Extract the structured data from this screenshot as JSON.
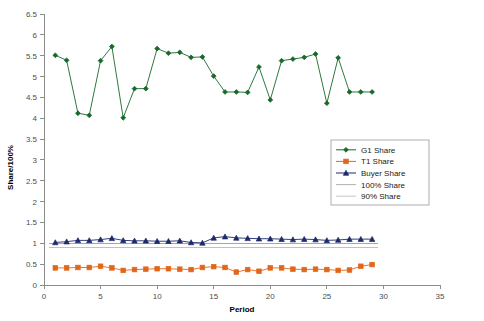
{
  "chart_data": {
    "type": "line",
    "title": "",
    "xlabel": "Period",
    "ylabel": "Share/100%",
    "xlim": [
      0,
      35
    ],
    "ylim": [
      0,
      6.5
    ],
    "xticks": [
      0,
      5,
      10,
      15,
      20,
      25,
      30,
      35
    ],
    "yticks": [
      0,
      0.5,
      1,
      1.5,
      2,
      2.5,
      3,
      3.5,
      4,
      4.5,
      5,
      5.5,
      6,
      6.5
    ],
    "grid": false,
    "legend_position": "center-right",
    "x": [
      1,
      2,
      3,
      4,
      5,
      6,
      7,
      8,
      9,
      10,
      11,
      12,
      13,
      14,
      15,
      16,
      17,
      18,
      19,
      20,
      21,
      22,
      23,
      24,
      25,
      26,
      27,
      28,
      29
    ],
    "series": [
      {
        "name": "G1 Share",
        "color": "#17692a",
        "marker": "diamond",
        "values": [
          5.51,
          5.39,
          4.12,
          4.07,
          5.38,
          5.72,
          4.01,
          4.71,
          4.71,
          5.67,
          5.56,
          5.58,
          5.46,
          5.47,
          5.01,
          4.63,
          4.63,
          4.62,
          5.23,
          4.44,
          5.38,
          5.42,
          5.46,
          5.54,
          4.36,
          5.45,
          4.63,
          4.63,
          4.63
        ]
      },
      {
        "name": "T1 Share",
        "color": "#e2661a",
        "marker": "square",
        "values": [
          0.41,
          0.41,
          0.42,
          0.42,
          0.45,
          0.41,
          0.35,
          0.37,
          0.38,
          0.39,
          0.39,
          0.38,
          0.37,
          0.42,
          0.44,
          0.42,
          0.31,
          0.37,
          0.33,
          0.41,
          0.41,
          0.38,
          0.37,
          0.38,
          0.37,
          0.35,
          0.36,
          0.45,
          0.49
        ]
      },
      {
        "name": "Buyer Share",
        "color": "#1b2a6b",
        "marker": "triangle",
        "values": [
          1.02,
          1.04,
          1.07,
          1.07,
          1.09,
          1.12,
          1.07,
          1.06,
          1.06,
          1.05,
          1.05,
          1.06,
          1.02,
          1.01,
          1.13,
          1.16,
          1.13,
          1.12,
          1.11,
          1.11,
          1.1,
          1.09,
          1.1,
          1.09,
          1.07,
          1.08,
          1.1,
          1.1,
          1.1
        ]
      },
      {
        "name": "100% Share",
        "color": "#a6a6a6",
        "marker": "none",
        "constant": 1.0
      },
      {
        "name": "90% Share",
        "color": "#c0c0c0",
        "marker": "none",
        "constant": 0.9
      }
    ],
    "legend": [
      {
        "label": "G1 Share"
      },
      {
        "label": "T1 Share"
      },
      {
        "label": "Buyer Share"
      },
      {
        "label": "100% Share"
      },
      {
        "label": "90% Share"
      }
    ],
    "tick_labels_x": [
      "0",
      "5",
      "10",
      "15",
      "20",
      "25",
      "30",
      "35"
    ],
    "tick_labels_y": [
      "0",
      "0.5",
      "1",
      "1.5",
      "2",
      "2.5",
      "3",
      "3.5",
      "4",
      "4.5",
      "5",
      "5.5",
      "6",
      "6.5"
    ]
  }
}
